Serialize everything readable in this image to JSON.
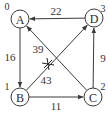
{
  "diagram": {
    "type": "directed-weighted-graph",
    "colors": {
      "line": "#3a3a3a",
      "text": "#2a2a2a",
      "background": "#ffffff"
    },
    "nodes": [
      {
        "id": "A",
        "label": "A",
        "index": "0",
        "x": 20,
        "y": 19,
        "ix": 7,
        "iy": 6
      },
      {
        "id": "B",
        "label": "B",
        "index": "1",
        "x": 20,
        "y": 97,
        "ix": 7,
        "iy": 86
      },
      {
        "id": "C",
        "label": "C",
        "index": "2",
        "x": 93,
        "y": 97,
        "ix": 103,
        "iy": 86
      },
      {
        "id": "D",
        "label": "D",
        "index": "3",
        "x": 94,
        "y": 18,
        "ix": 103,
        "iy": 8
      }
    ],
    "edges": [
      {
        "from": "D",
        "to": "A",
        "weight": "22",
        "lx": 56,
        "ly": 11
      },
      {
        "from": "A",
        "to": "B",
        "weight": "16",
        "lx": 10,
        "ly": 57
      },
      {
        "from": "B",
        "to": "C",
        "weight": "11",
        "lx": 56,
        "ly": 106
      },
      {
        "from": "C",
        "to": "D",
        "weight": "9",
        "lx": 103,
        "ly": 58
      },
      {
        "from": "C",
        "to": "A",
        "weight": "39",
        "lx": 38,
        "ly": 49
      },
      {
        "from": "B",
        "to": "D",
        "weight": "43",
        "lx": 46,
        "ly": 80
      }
    ],
    "cross_mark": {
      "x": 48,
      "y": 64
    }
  }
}
